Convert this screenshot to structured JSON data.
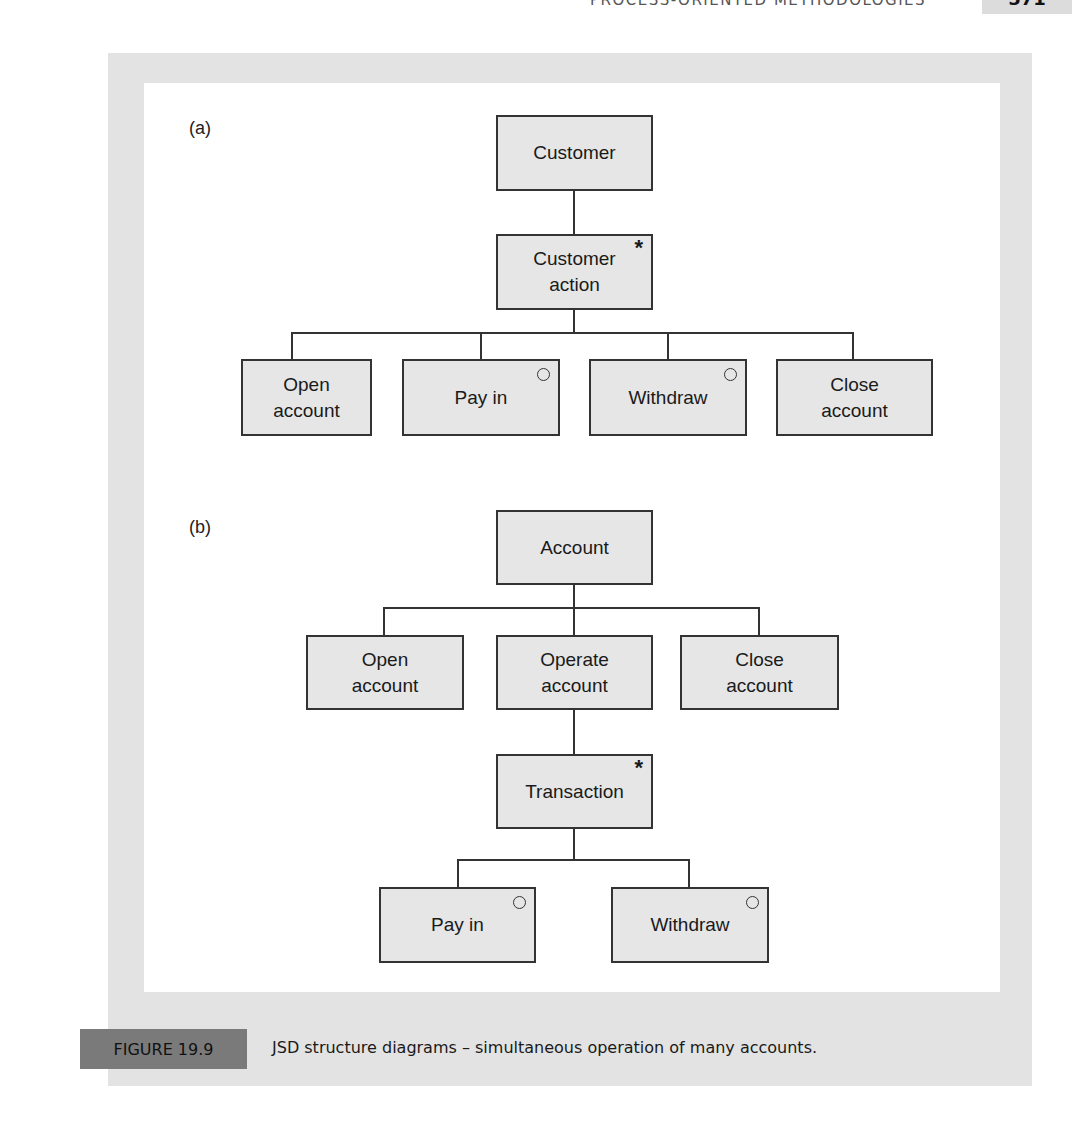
{
  "running_header": {
    "title": "PROCESS-ORIENTED METHODOLOGIES",
    "page_number": "571"
  },
  "figure": {
    "label": "FIGURE 19.9",
    "caption": "JSD structure diagrams – simultaneous operation of many accounts.",
    "colors": {
      "frame": "#e3e3e3",
      "panel": "#ffffff",
      "box_fill": "#e6e6e6",
      "box_border": "#333333",
      "label_box": "#7a7a7a"
    }
  },
  "diagram_a": {
    "label": "(a)",
    "root": {
      "text": "Customer"
    },
    "iteration": {
      "text": "Customer\naction",
      "marker": "*"
    },
    "children": [
      {
        "text": "Open\naccount",
        "marker": ""
      },
      {
        "text": "Pay in",
        "marker": "o"
      },
      {
        "text": "Withdraw",
        "marker": "o"
      },
      {
        "text": "Close\naccount",
        "marker": ""
      }
    ]
  },
  "diagram_b": {
    "label": "(b)",
    "root": {
      "text": "Account"
    },
    "children": [
      {
        "text": "Open\naccount",
        "marker": ""
      },
      {
        "text": "Operate\naccount",
        "marker": ""
      },
      {
        "text": "Close\naccount",
        "marker": ""
      }
    ],
    "iteration": {
      "text": "Transaction",
      "marker": "*"
    },
    "grandchildren": [
      {
        "text": "Pay in",
        "marker": "o"
      },
      {
        "text": "Withdraw",
        "marker": "o"
      }
    ]
  }
}
